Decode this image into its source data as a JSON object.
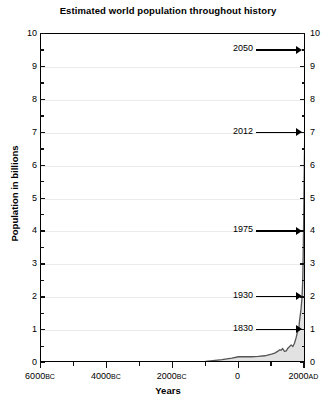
{
  "chart_data": {
    "type": "area",
    "title": "Estimated world population throughout history",
    "xlabel": "Years",
    "ylabel": "Population in billions",
    "xlim": [
      -6000,
      2050
    ],
    "ylim": [
      0,
      10
    ],
    "grid": true,
    "legend": "none",
    "line_color": "#555555",
    "fill_color": "#e2e2e2",
    "x_major_ticks": [
      {
        "value": -6000,
        "label": "6000",
        "era": "BC"
      },
      {
        "value": -4000,
        "label": "4000",
        "era": "BC"
      },
      {
        "value": -2000,
        "label": "2000",
        "era": "BC"
      },
      {
        "value": 0,
        "label": "0",
        "era": ""
      },
      {
        "value": 2000,
        "label": "2000",
        "era": "AD"
      }
    ],
    "x_minor_ticks": [
      -5000,
      -3000,
      -1000,
      1000
    ],
    "y_major_ticks": [
      0,
      1,
      2,
      3,
      4,
      5,
      6,
      7,
      8,
      9,
      10
    ],
    "y_minor_ticks": [
      0.5,
      1.5,
      2.5,
      3.5,
      4.5,
      5.5,
      6.5,
      7.5,
      8.5,
      9.5
    ],
    "y_tick_labels_left": [
      "0",
      "1",
      "2",
      "3",
      "4",
      "5",
      "6",
      "7",
      "8",
      "9",
      "10"
    ],
    "y_tick_labels_right": [
      "0",
      "1",
      "2",
      "3",
      "4",
      "5",
      "6",
      "7",
      "8",
      "9",
      "10"
    ],
    "x": [
      -6000,
      -5000,
      -4000,
      -3000,
      -2000,
      -1500,
      -1000,
      -500,
      -400,
      -200,
      0,
      200,
      400,
      600,
      800,
      1000,
      1100,
      1200,
      1250,
      1300,
      1340,
      1400,
      1450,
      1500,
      1600,
      1650,
      1700,
      1750,
      1800,
      1830,
      1850,
      1900,
      1930,
      1950,
      1960,
      1975,
      1980,
      1990,
      2000,
      2012,
      2020,
      2030,
      2040,
      2050
    ],
    "y": [
      0.005,
      0.01,
      0.02,
      0.025,
      0.03,
      0.04,
      0.05,
      0.1,
      0.12,
      0.15,
      0.19,
      0.19,
      0.19,
      0.2,
      0.22,
      0.27,
      0.3,
      0.36,
      0.4,
      0.39,
      0.44,
      0.35,
      0.37,
      0.45,
      0.55,
      0.5,
      0.6,
      0.77,
      0.98,
      1.0,
      1.26,
      1.65,
      2.0,
      2.5,
      3.0,
      4.0,
      4.4,
      5.3,
      6.1,
      7.0,
      7.8,
      8.5,
      9.2,
      9.5
    ],
    "annotations": [
      {
        "label": "1830",
        "year": 1830,
        "value": 1
      },
      {
        "label": "1930",
        "year": 1930,
        "value": 2
      },
      {
        "label": "1975",
        "year": 1975,
        "value": 4
      },
      {
        "label": "2012",
        "year": 2012,
        "value": 7
      },
      {
        "label": "2050",
        "year": 2050,
        "value": 9.5
      }
    ]
  }
}
